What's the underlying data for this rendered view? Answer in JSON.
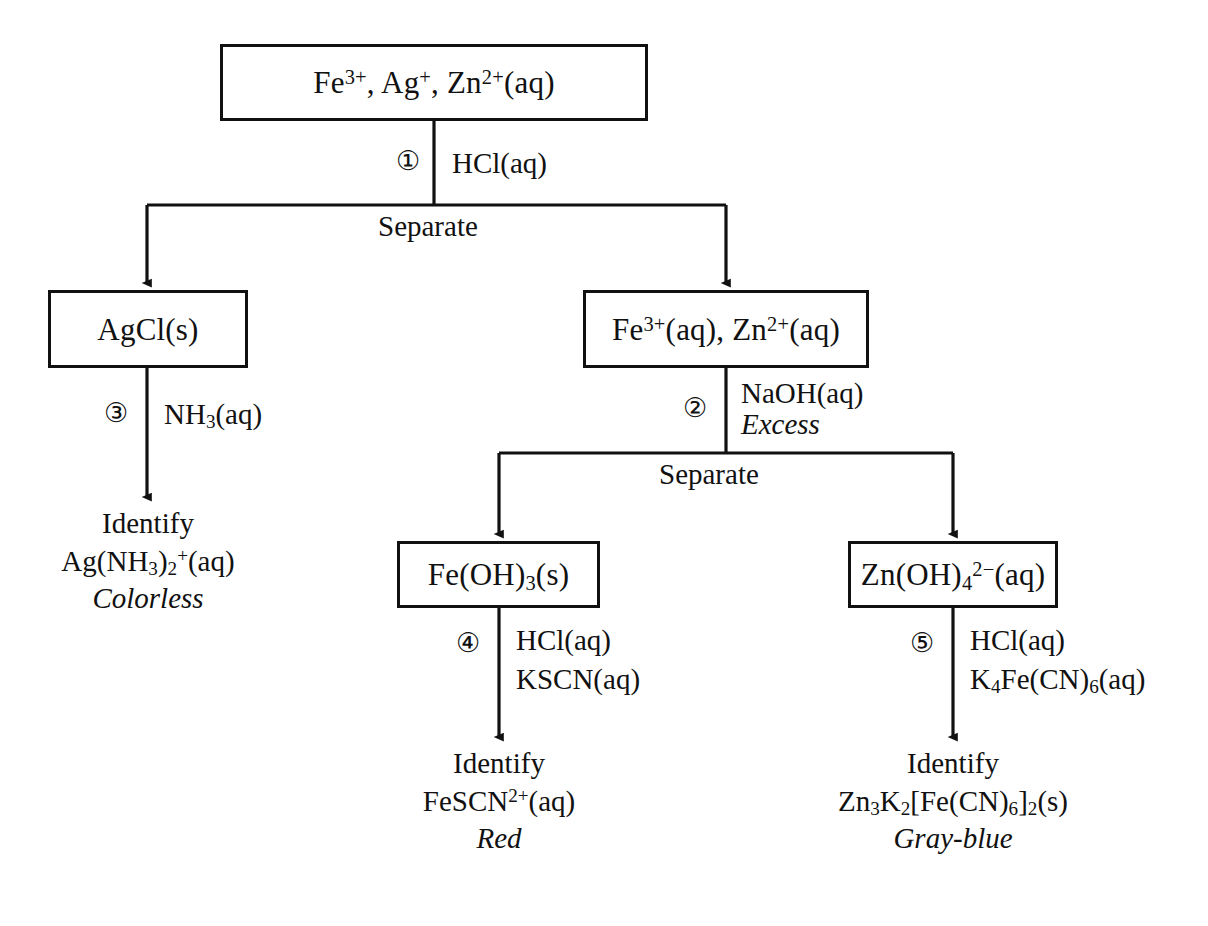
{
  "diagram": {
    "separate_label_1": "Separate",
    "separate_label_2": "Separate"
  },
  "nodes": {
    "start": {
      "name": "start-mixture-box",
      "formula_html": "Fe<sup>3+</sup>, Ag<sup>+</sup>, Zn<sup>2+</sup>(aq)"
    },
    "agcl": {
      "name": "agcl-box",
      "formula_html": "AgCl(s)"
    },
    "fezn": {
      "name": "fe-zn-box",
      "formula_html": "Fe<sup>3+</sup>(aq), Zn<sup>2+</sup>(aq)"
    },
    "feoh3": {
      "name": "fe-hydroxide-box",
      "formula_html": "Fe(OH)<sub>3</sub>(s)"
    },
    "znoh4": {
      "name": "zincate-box",
      "formula_html": "Zn(OH)<sub>4</sub><sup>2&#8722;</sup>(aq)"
    }
  },
  "steps": {
    "one": {
      "number": "①",
      "reagents_html": "HCl(aq)"
    },
    "two": {
      "number": "②",
      "reagents_html": "NaOH(aq)",
      "note": "Excess"
    },
    "three": {
      "number": "③",
      "reagents_html": "NH<sub>3</sub>(aq)"
    },
    "four": {
      "number": "④",
      "reagents_line1_html": "HCl(aq)",
      "reagents_line2_html": "KSCN(aq)"
    },
    "five": {
      "number": "⑤",
      "reagents_line1_html": "HCl(aq)",
      "reagents_line2_html": "K<sub>4</sub>Fe(CN)<sub>6</sub>(aq)"
    }
  },
  "results": {
    "silver": {
      "identify": "Identify",
      "species_html": "Ag(NH<sub>3</sub>)<sub>2</sub><sup>+</sup>(aq)",
      "color": "Colorless"
    },
    "iron": {
      "identify": "Identify",
      "species_html": "FeSCN<sup>2+</sup>(aq)",
      "color": "Red"
    },
    "zinc": {
      "identify": "Identify",
      "species_html": "Zn<sub>3</sub>K<sub>2</sub>[Fe(CN)<sub>6</sub>]<sub>2</sub>(s)",
      "color": "Gray-blue"
    }
  },
  "style": {
    "line_color": "#111111",
    "background": "#ffffff",
    "text_color": "#111111"
  }
}
